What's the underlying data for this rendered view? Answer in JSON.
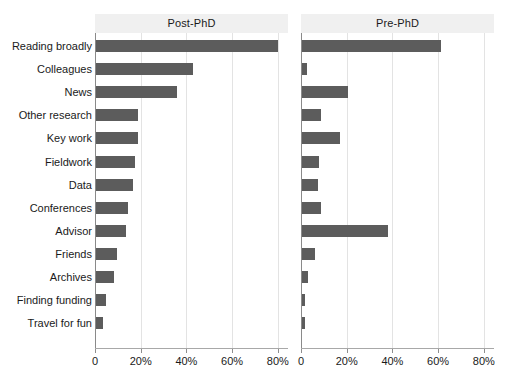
{
  "chart_data": {
    "type": "bar",
    "title": "",
    "orientation": "horizontal",
    "xlabel": "",
    "ylabel": "",
    "xlim": [
      0,
      85
    ],
    "xticks": [
      0,
      20,
      40,
      60,
      80
    ],
    "xtick_labels": [
      "0",
      "20%",
      "40%",
      "60%",
      "80%"
    ],
    "grid": true,
    "legend": "none",
    "facet_layout": "1x2",
    "categories": [
      "Reading broadly",
      "Colleagues",
      "News",
      "Other research",
      "Key work",
      "Fieldwork",
      "Data",
      "Conferences",
      "Advisor",
      "Friends",
      "Archives",
      "Finding funding",
      "Travel for fun"
    ],
    "series": [
      {
        "name": "Post-PhD",
        "values": [
          79.5,
          42.5,
          35.5,
          18.5,
          18.5,
          17.0,
          16.0,
          14.0,
          13.0,
          9.0,
          8.0,
          4.5,
          3.0
        ]
      },
      {
        "name": "Pre-PhD",
        "values": [
          61.0,
          2.0,
          20.0,
          8.5,
          16.5,
          7.5,
          7.0,
          8.5,
          37.5,
          5.5,
          2.5,
          1.5,
          1.5
        ]
      }
    ],
    "colors": {
      "bar": "#5c5c5c",
      "panel_strip": "#f0f0f0",
      "gridline": "#e3e3e3",
      "axis": "#a8a8a8",
      "background": "#ffffff",
      "text": "#1a1a1a"
    }
  },
  "panels": [
    {
      "label": "Post-PhD"
    },
    {
      "label": "Pre-PhD"
    }
  ]
}
